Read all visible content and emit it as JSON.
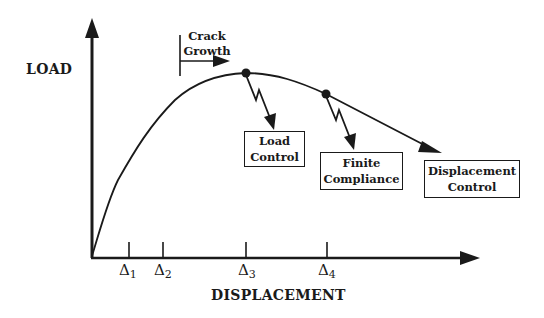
{
  "diagram": {
    "y_axis_label": "LOAD",
    "x_axis_label": "DISPLACEMENT",
    "annotation": {
      "line1": "Crack",
      "line2": "Growth"
    },
    "ticks": [
      {
        "symbol": "Δ",
        "sub": "1"
      },
      {
        "symbol": "Δ",
        "sub": "2"
      },
      {
        "symbol": "Δ",
        "sub": "3"
      },
      {
        "symbol": "Δ",
        "sub": "4"
      }
    ],
    "boxes": [
      {
        "line1": "Load",
        "line2": "Control"
      },
      {
        "line1": "Finite",
        "line2": "Compliance"
      },
      {
        "line1": "Displacement",
        "line2": "Control"
      }
    ],
    "colors": {
      "ink": "#1a1a1a",
      "background": "#ffffff"
    }
  }
}
